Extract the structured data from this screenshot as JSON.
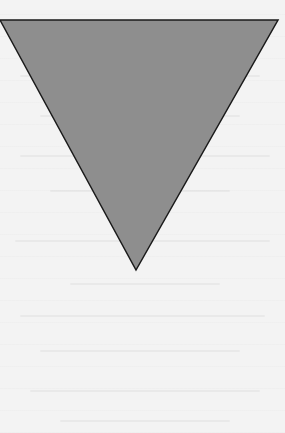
{
  "diagram": {
    "shape": "inverted-triangle",
    "fill_color": "#8e8e8e",
    "stroke_color": "#1a1a1a",
    "points": [
      [
        0,
        20
      ],
      [
        278,
        20
      ],
      [
        136,
        270
      ]
    ]
  },
  "background": {
    "color": "#f3f3f3",
    "note": ""
  }
}
